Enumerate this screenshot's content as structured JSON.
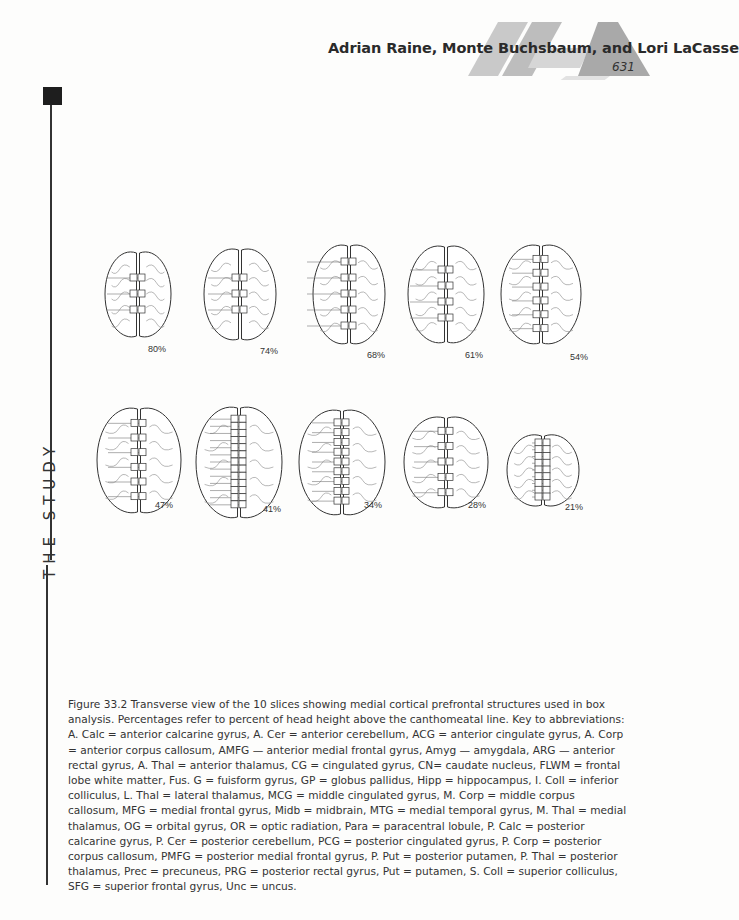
{
  "header": {
    "authors": "Adrian Raine, Monte Buchsbaum, and Lori LaCasse",
    "page_number": "631"
  },
  "side_label": "THE STUDY",
  "figure": {
    "rows": [
      [
        {
          "percent": "80%",
          "labels": [
            "SFG",
            "Para",
            "Prec"
          ]
        },
        {
          "percent": "74%",
          "labels": [
            "SFG",
            "Para",
            "Prec"
          ]
        },
        {
          "percent": "68%",
          "labels": [
            "SFG",
            "AMFG",
            "PMFG",
            "Para",
            "Prec"
          ]
        },
        {
          "percent": "61%",
          "labels": [
            "SFG",
            "MFG",
            "CG",
            "Prec"
          ]
        },
        {
          "percent": "54%",
          "labels": [
            "MFG",
            "FLWM",
            "ACG",
            "MCG",
            "PCG",
            "Prec"
          ]
        }
      ],
      [
        {
          "percent": "47%",
          "labels": [
            "MFG",
            "FLWM",
            "A. Corp",
            "M. Corp",
            "P. Corp",
            "PCG"
          ]
        },
        {
          "percent": "41%",
          "labels": [
            "CG",
            "FLWM",
            "CN",
            "Put",
            "P. Put",
            "A. Thal",
            "M. Thal",
            "L. Thal",
            "P. Thal",
            "PCG",
            "OR",
            "A. Calc",
            "P. Calc"
          ]
        },
        {
          "percent": "34%",
          "labels": [
            "CG",
            "FLWM",
            "CN",
            "Put",
            "MTG",
            "GP",
            "S. Coll",
            "Hipp",
            "Fus. G"
          ]
        },
        {
          "percent": "28%",
          "labels": [
            "ACG",
            "FLWM",
            "Put",
            "Hipp",
            "I. Coll"
          ]
        },
        {
          "percent": "21%",
          "labels": [
            "ARG",
            "OG",
            "PRG",
            "Amyg",
            "Unc",
            "Hipp",
            "Midb",
            "A. Cer",
            "P. Cer"
          ]
        }
      ]
    ]
  },
  "caption": "Figure 33.2  Transverse view of the 10 slices showing medial cortical prefrontal structures used in box analysis. Percentages refer to percent of head height above the canthomeatal line. Key to abbreviations: A. Calc = anterior calcarine gyrus, A. Cer = anterior cerebellum, ACG = anterior cingulate gyrus, A. Corp = anterior corpus callosum, AMFG — anterior medial frontal gyrus, Amyg — amygdala, ARG — anterior rectal gyrus, A. Thal = anterior thalamus, CG = cingulated gyrus, CN= caudate nucleus, FLWM = frontal lobe white matter, Fus. G = fuisform gyrus, GP = globus pallidus, Hipp = hippocampus, I. Coll = inferior colliculus, L. Thal = lateral thalamus, MCG = middle cingulated gyrus, M. Corp = middle corpus callosum, MFG = medial frontal gyrus, Midb = midbrain, MTG = medial temporal gyrus, M. Thal = medial thalamus, OG = orbital gyrus, OR = optic radiation, Para = paracentral lobule, P. Calc = posterior calcarine gyrus, P. Cer = posterior cerebellum, PCG = posterior cingulated gyrus, P. Corp = posterior corpus callosum, PMFG = posterior medial frontal gyrus, P. Put = posterior putamen, P. Thal = posterior thalamus, Prec = precuneus, PRG = posterior rectal gyrus, Put = putamen, S. Coll = superior colliculus, SFG = superior frontal gyrus, Unc = uncus."
}
